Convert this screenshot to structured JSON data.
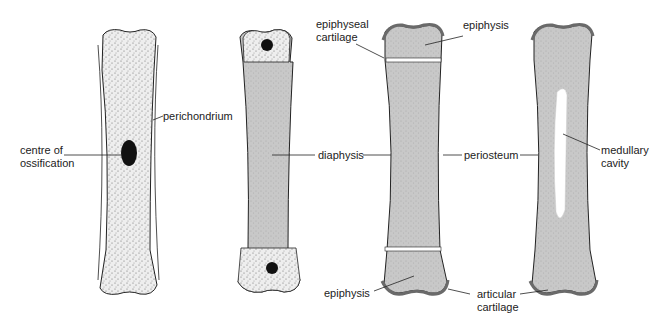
{
  "diagram": {
    "stages": [
      {
        "id": "stage-1",
        "labels": [
          "perichondrium",
          "centre of ossification"
        ]
      },
      {
        "id": "stage-2",
        "labels": [
          "diaphysis"
        ]
      },
      {
        "id": "stage-3",
        "labels": [
          "epiphyseal cartilage",
          "epiphysis",
          "periosteum",
          "epiphysis",
          "articular cartilage"
        ]
      },
      {
        "id": "stage-4",
        "labels": [
          "medullary cavity"
        ]
      }
    ],
    "labels": {
      "perichondrium": "perichondrium",
      "centre_line1": "centre of",
      "centre_line2": "ossification",
      "diaphysis": "diaphysis",
      "epiphyseal_line1": "epiphyseal",
      "epiphyseal_line2": "cartilage",
      "epiphysis_top": "epiphysis",
      "periosteum": "periosteum",
      "medullary_line1": "medullary",
      "medullary_line2": "cavity",
      "epiphysis_bottom": "epiphysis",
      "articular_line1": "articular",
      "articular_line2": "cartilage"
    },
    "colors": {
      "cartilage_fill": "#ececec",
      "bone_fill": "#c9c9c9",
      "articular": "#6a6a6a",
      "ink": "#222222"
    }
  }
}
